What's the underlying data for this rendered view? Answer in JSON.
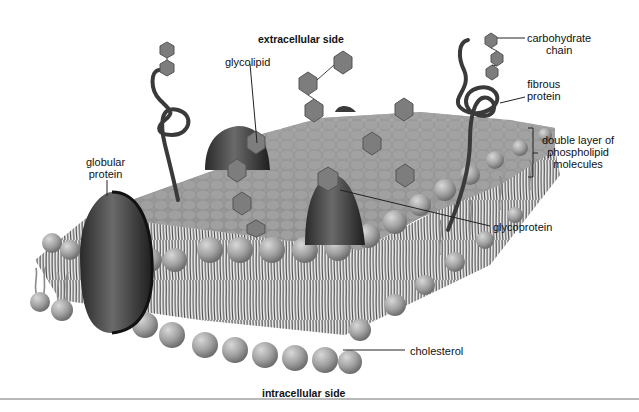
{
  "diagram": {
    "title_top": "extracellular side",
    "title_bottom": "intracellular side",
    "labels": {
      "carbohydrate_chain": [
        "carbohydrate",
        "chain"
      ],
      "fibrous_protein": [
        "fibrous",
        "protein"
      ],
      "glycolipid": "glycolipid",
      "double_layer": [
        "double layer of",
        "phospholipid",
        "molecules"
      ],
      "globular_protein": [
        "globular",
        "protein"
      ],
      "glycoprotein": "glycoprotein",
      "cholesterol": "cholesterol"
    },
    "colors": {
      "head": "#9a9a9a",
      "head_light": "#c4c4c4",
      "tail": "#8a8a8a",
      "protein": "#3a3a3a",
      "hexagon": "#7d7d7d",
      "leader_line": "#222222"
    }
  }
}
